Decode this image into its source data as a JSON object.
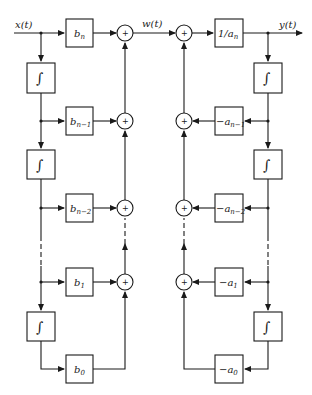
{
  "diagram": {
    "signals": {
      "input": "x(t)",
      "intermediate": "w(t)",
      "output": "y(t)"
    },
    "left_section": {
      "gains": [
        {
          "base": "b",
          "sub": "n"
        },
        {
          "base": "b",
          "sub": "n−1"
        },
        {
          "base": "b",
          "sub": "n−2"
        },
        {
          "base": "b",
          "sub": "1"
        },
        {
          "base": "b",
          "sub": "0"
        }
      ],
      "integrator_symbol": "∫"
    },
    "right_section": {
      "gains": [
        {
          "base": "1/a",
          "sub": "n"
        },
        {
          "base": "−a",
          "sub": "n−1"
        },
        {
          "base": "−a",
          "sub": "n−2"
        },
        {
          "base": "−a",
          "sub": "1"
        },
        {
          "base": "−a",
          "sub": "0"
        }
      ],
      "integrator_symbol": "∫"
    },
    "summer_symbol": "+"
  }
}
